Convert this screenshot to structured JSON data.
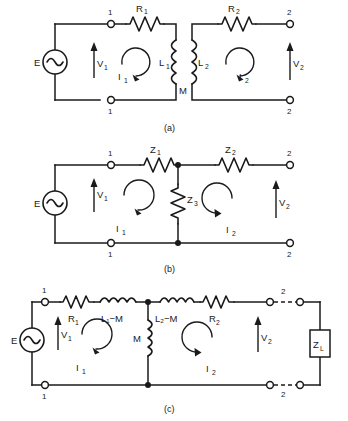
{
  "figure": {
    "background_color": "#ffffff",
    "ink_color": "#1a1a1a"
  },
  "panels": [
    {
      "caption": "(a)",
      "description": "Magnetically coupled transformer circuit with mutual inductance M",
      "source": {
        "label": "E",
        "type": "ac-voltage-source"
      },
      "voltages": [
        {
          "label": "V",
          "sub": "1",
          "direction": "up"
        },
        {
          "label": "V",
          "sub": "2",
          "direction": "up"
        }
      ],
      "currents": [
        {
          "label": "I",
          "sub": "1",
          "direction": "clockwise"
        },
        {
          "label": "I",
          "sub": "2",
          "direction": "clockwise"
        }
      ],
      "components": [
        {
          "label": "R",
          "sub": "1",
          "type": "resistor",
          "orientation": "horizontal"
        },
        {
          "label": "R",
          "sub": "2",
          "type": "resistor",
          "orientation": "horizontal"
        },
        {
          "label": "L",
          "sub": "1",
          "type": "inductor",
          "orientation": "vertical"
        },
        {
          "label": "L",
          "sub": "2",
          "type": "inductor",
          "orientation": "vertical"
        },
        {
          "label": "M",
          "sub": "",
          "type": "mutual-coupling",
          "orientation": "none"
        }
      ],
      "terminals": [
        {
          "label": "1",
          "position": "top-left"
        },
        {
          "label": "1",
          "position": "bottom-left"
        },
        {
          "label": "2",
          "position": "top-right"
        },
        {
          "label": "2",
          "position": "bottom-right"
        }
      ]
    },
    {
      "caption": "(b)",
      "description": "Equivalent tee network of impedances",
      "source": {
        "label": "E",
        "type": "ac-voltage-source"
      },
      "voltages": [
        {
          "label": "V",
          "sub": "1",
          "direction": "up"
        },
        {
          "label": "V",
          "sub": "2",
          "direction": "up"
        }
      ],
      "currents": [
        {
          "label": "I",
          "sub": "1",
          "direction": "clockwise"
        },
        {
          "label": "I",
          "sub": "2",
          "direction": "clockwise"
        }
      ],
      "components": [
        {
          "label": "Z",
          "sub": "1",
          "type": "resistor",
          "orientation": "horizontal"
        },
        {
          "label": "Z",
          "sub": "2",
          "type": "resistor",
          "orientation": "horizontal"
        },
        {
          "label": "Z",
          "sub": "3",
          "type": "resistor",
          "orientation": "vertical"
        }
      ],
      "terminals": [
        {
          "label": "1",
          "position": "top-left"
        },
        {
          "label": "1",
          "position": "bottom-left"
        },
        {
          "label": "2",
          "position": "top-right"
        },
        {
          "label": "2",
          "position": "bottom-right"
        }
      ]
    },
    {
      "caption": "(c)",
      "description": "Tee equivalent of the coupled circuit terminated in a load impedance",
      "source": {
        "label": "E",
        "type": "ac-voltage-source"
      },
      "voltages": [
        {
          "label": "V",
          "sub": "1",
          "direction": "up"
        },
        {
          "label": "V",
          "sub": "2",
          "direction": "down"
        }
      ],
      "currents": [
        {
          "label": "I",
          "sub": "1",
          "direction": "clockwise"
        },
        {
          "label": "I",
          "sub": "2",
          "direction": "clockwise"
        }
      ],
      "components": [
        {
          "label": "R",
          "sub": "1",
          "type": "resistor",
          "orientation": "horizontal"
        },
        {
          "label": "L₁−M",
          "sub": "",
          "type": "inductor",
          "orientation": "horizontal"
        },
        {
          "label": "L₂−M",
          "sub": "",
          "type": "inductor",
          "orientation": "horizontal"
        },
        {
          "label": "R",
          "sub": "2",
          "type": "resistor",
          "orientation": "horizontal"
        },
        {
          "label": "M",
          "sub": "",
          "type": "inductor",
          "orientation": "vertical"
        },
        {
          "label": "Z",
          "sub": "L",
          "type": "load-box",
          "orientation": "vertical"
        }
      ],
      "terminals": [
        {
          "label": "1",
          "position": "top-left"
        },
        {
          "label": "1",
          "position": "bottom-left"
        },
        {
          "label": "2",
          "position": "top-right"
        },
        {
          "label": "2",
          "position": "bottom-right"
        }
      ]
    }
  ],
  "labels": {
    "E": "E",
    "M": "M",
    "I": "I",
    "V": "V",
    "R": "R",
    "L": "L",
    "Z": "Z",
    "one": "1",
    "two": "2",
    "three": "3",
    "L_sub": "L",
    "L1mM": "L₁−M",
    "L2mM": "L₂−M",
    "cap_a": "(a)",
    "cap_b": "(b)",
    "cap_c": "(c)"
  }
}
